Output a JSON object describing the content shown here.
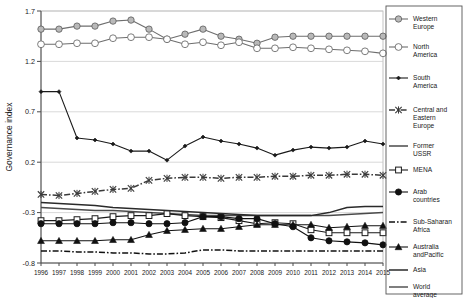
{
  "chart_data": {
    "type": "line",
    "title": "",
    "xlabel": "",
    "ylabel": "Governance index",
    "ylim": [
      -0.8,
      1.7
    ],
    "yticks": [
      -0.8,
      -0.3,
      0.2,
      0.7,
      1.2,
      1.7
    ],
    "ytick_labels": [
      "-0.8",
      "-0.3",
      "0.2",
      "0.7",
      "1.2",
      "1.7"
    ],
    "grid": true,
    "legend_position": "right",
    "categories": [
      1996,
      1997,
      1998,
      1999,
      2000,
      2001,
      2002,
      2003,
      2004,
      2005,
      2006,
      2007,
      2008,
      2009,
      2010,
      2011,
      2012,
      2013,
      2014,
      2015
    ],
    "xtick_labels": [
      "1996",
      "1997",
      "1998",
      "1999",
      "2000",
      "2001",
      "2002",
      "2003",
      "2004",
      "2005",
      "2006",
      "2007",
      "2008",
      "2009",
      "2010",
      "2011",
      "2012",
      "2013",
      "2014",
      "2015"
    ],
    "series": [
      {
        "name": "Western Europe",
        "marker": "circle-gray",
        "line": "solid",
        "color": "#6e6e6e",
        "values": [
          1.52,
          1.52,
          1.55,
          1.55,
          1.6,
          1.61,
          1.52,
          1.42,
          1.47,
          1.52,
          1.45,
          1.42,
          1.38,
          1.44,
          1.45,
          1.45,
          1.45,
          1.45,
          1.45,
          1.45
        ]
      },
      {
        "name": "North America",
        "marker": "circle-open",
        "line": "solid",
        "color": "#6e6e6e",
        "values": [
          1.37,
          1.37,
          1.38,
          1.38,
          1.43,
          1.44,
          1.44,
          1.42,
          1.37,
          1.39,
          1.36,
          1.39,
          1.33,
          1.33,
          1.34,
          1.33,
          1.32,
          1.31,
          1.3,
          1.28
        ]
      },
      {
        "name": "South America",
        "marker": "diamond-small",
        "line": "solid",
        "color": "#1a1a1a",
        "values": [
          0.9,
          0.9,
          0.44,
          0.42,
          0.38,
          0.31,
          0.31,
          0.22,
          0.36,
          0.45,
          0.41,
          0.38,
          0.34,
          0.27,
          0.32,
          0.35,
          0.34,
          0.35,
          0.41,
          0.38
        ]
      },
      {
        "name": "Central and Eastern Europe",
        "marker": "cross",
        "line": "dashdot",
        "color": "#3a3a3a",
        "values": [
          -0.12,
          -0.13,
          -0.11,
          -0.09,
          -0.07,
          -0.06,
          0.02,
          0.04,
          0.05,
          0.05,
          0.04,
          0.05,
          0.05,
          0.06,
          0.06,
          0.07,
          0.07,
          0.08,
          0.08,
          0.07
        ]
      },
      {
        "name": "Former USSR",
        "marker": "none",
        "line": "solid",
        "color": "#4a4a4a",
        "values": [
          -0.25,
          -0.26,
          -0.27,
          -0.28,
          -0.28,
          -0.29,
          -0.3,
          -0.31,
          -0.32,
          -0.33,
          -0.33,
          -0.33,
          -0.33,
          -0.33,
          -0.33,
          -0.33,
          -0.33,
          -0.32,
          -0.31,
          -0.3
        ]
      },
      {
        "name": "MENA",
        "marker": "square-open",
        "line": "solid",
        "color": "#1a1a1a",
        "values": [
          -0.38,
          -0.38,
          -0.37,
          -0.36,
          -0.34,
          -0.33,
          -0.33,
          -0.31,
          -0.33,
          -0.34,
          -0.35,
          -0.38,
          -0.41,
          -0.4,
          -0.41,
          -0.47,
          -0.5,
          -0.5,
          -0.5,
          -0.5
        ]
      },
      {
        "name": "Arab countries",
        "marker": "circle-filled",
        "line": "solid",
        "color": "#111111",
        "values": [
          -0.41,
          -0.41,
          -0.41,
          -0.41,
          -0.4,
          -0.4,
          -0.41,
          -0.41,
          -0.4,
          -0.34,
          -0.34,
          -0.36,
          -0.36,
          -0.41,
          -0.44,
          -0.55,
          -0.58,
          -0.59,
          -0.6,
          -0.62
        ]
      },
      {
        "name": "Sub-Saharan Africa",
        "marker": "none",
        "line": "dashdot",
        "color": "#111111",
        "values": [
          -0.68,
          -0.68,
          -0.69,
          -0.69,
          -0.7,
          -0.7,
          -0.71,
          -0.71,
          -0.7,
          -0.67,
          -0.67,
          -0.68,
          -0.68,
          -0.68,
          -0.68,
          -0.68,
          -0.68,
          -0.68,
          -0.68,
          -0.68
        ]
      },
      {
        "name": "Australia andPacific",
        "marker": "triangle-filled",
        "line": "solid",
        "color": "#111111",
        "values": [
          -0.58,
          -0.58,
          -0.58,
          -0.58,
          -0.57,
          -0.57,
          -0.52,
          -0.48,
          -0.47,
          -0.46,
          -0.46,
          -0.44,
          -0.42,
          -0.42,
          -0.42,
          -0.42,
          -0.45,
          -0.44,
          -0.43,
          -0.43
        ]
      },
      {
        "name": "Asia",
        "marker": "none",
        "line": "solid",
        "color": "#2a2a2a",
        "values": [
          -0.2,
          -0.21,
          -0.22,
          -0.23,
          -0.25,
          -0.26,
          -0.27,
          -0.28,
          -0.29,
          -0.3,
          -0.31,
          -0.32,
          -0.33,
          -0.33,
          -0.33,
          -0.33,
          -0.3,
          -0.25,
          -0.24,
          -0.24
        ]
      },
      {
        "name": "World average",
        "marker": "none",
        "line": "solid",
        "color": "#555555",
        "values": [
          null,
          null,
          null,
          null,
          null,
          null,
          null,
          null,
          null,
          null,
          null,
          null,
          null,
          null,
          null,
          null,
          null,
          null,
          null,
          null
        ]
      }
    ]
  },
  "legend": {
    "items": [
      {
        "label_line1": "Western",
        "label_line2": "Europe"
      },
      {
        "label_line1": "North",
        "label_line2": "America"
      },
      {
        "label_line1": "South",
        "label_line2": "America"
      },
      {
        "label_line1": "Central and",
        "label_line2": "Eastern",
        "label_line3": "Europe"
      },
      {
        "label_line1": "Former",
        "label_line2": "USSR"
      },
      {
        "label_line1": "MENA",
        "label_line2": ""
      },
      {
        "label_line1": "Arab",
        "label_line2": "countries"
      },
      {
        "label_line1": "Sub-Saharan",
        "label_line2": "Africa"
      },
      {
        "label_line1": "Australia",
        "label_line2": "andPacific"
      },
      {
        "label_line1": "Asia",
        "label_line2": ""
      },
      {
        "label_line1": "World",
        "label_line2": "average"
      }
    ]
  }
}
